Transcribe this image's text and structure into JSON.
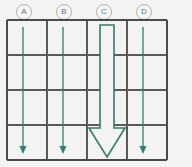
{
  "figure": {
    "name": "grid-with-down-arrows",
    "background_color": "#f3f3f1",
    "grid": {
      "line_color": "#5a5a58",
      "outer_line_color": "#4a4a48",
      "columns": 4,
      "rows": 4,
      "x_left": 7,
      "x_right": 167,
      "y_top": 20,
      "y_bottom": 160,
      "vertical_lines": [
        7,
        47,
        87,
        127,
        167
      ],
      "horizontal_lines": [
        20,
        55,
        90,
        125,
        160
      ]
    },
    "column_labels": [
      {
        "id": "A",
        "text": "A",
        "center_x": 23
      },
      {
        "id": "B",
        "text": "B",
        "center_x": 63
      },
      {
        "id": "C",
        "text": "C",
        "center_x": 103
      },
      {
        "id": "D",
        "text": "D",
        "center_x": 143
      }
    ],
    "label_color": "#6e6e6c",
    "label_circle_color": "#b4b4b2",
    "arrow_color": "#2f7d6e",
    "arrows": [
      {
        "column": "A",
        "style": "thin",
        "x": 23,
        "y_start": 27,
        "y_end": 153,
        "direction": "down"
      },
      {
        "column": "B",
        "style": "thin",
        "x": 63,
        "y_start": 27,
        "y_end": 153,
        "direction": "down"
      },
      {
        "column": "C",
        "style": "large-hollow",
        "x": 107,
        "y_start": 25,
        "y_end": 157,
        "shaft_half_width": 7,
        "head_half_width": 18,
        "head_start_y": 128,
        "direction": "down"
      },
      {
        "column": "D",
        "style": "thin",
        "x": 143,
        "y_start": 27,
        "y_end": 153,
        "direction": "down"
      }
    ]
  }
}
